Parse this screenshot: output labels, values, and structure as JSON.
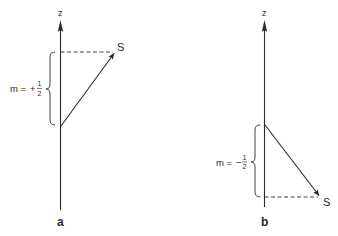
{
  "colors": {
    "ink": "#2a2a2a",
    "background": "#ffffff"
  },
  "panels": [
    {
      "id": "a",
      "panel_label": "a",
      "axis_label": "z",
      "vector_label": "S",
      "m_prefix": "m =",
      "m_sign": "+",
      "m_num": "1",
      "m_den": "2",
      "m_value": "+1/2"
    },
    {
      "id": "b",
      "panel_label": "b",
      "axis_label": "z",
      "vector_label": "S",
      "m_prefix": "m =",
      "m_sign": "−",
      "m_num": "1",
      "m_den": "2",
      "m_value": "-1/2"
    }
  ]
}
